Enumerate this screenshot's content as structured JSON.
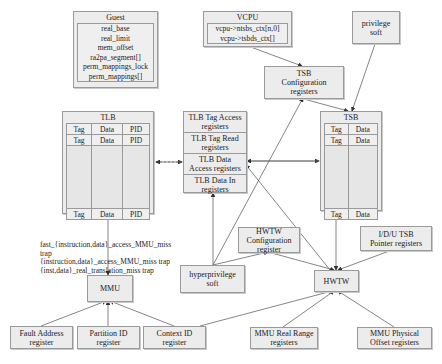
{
  "guest": {
    "title": "Guest",
    "fields": [
      "real_base",
      "real_limit",
      "mem_offset",
      "ra2pa_segment[]",
      "perm_mappings_lock",
      "perm_mappings[]"
    ]
  },
  "vcpu": {
    "title": "VCPU",
    "fields": [
      "vcpu->ntsbs_ctx[n,0]",
      "vcpu->tsbds_ctx[]"
    ]
  },
  "privilege_soft": {
    "line1": "privilege",
    "line2": "soft"
  },
  "tsb_config": {
    "line1": "TSB",
    "line2": "Configuration",
    "line3": "registers"
  },
  "tlb": {
    "title": "TLB",
    "columns": [
      "Tag",
      "Data",
      "PID"
    ],
    "rows": [
      [
        "Tag",
        "Data",
        "PID"
      ],
      [
        "Tag",
        "Data",
        "PID"
      ],
      [
        "",
        "",
        ""
      ],
      [
        "Tag",
        "Data",
        "PID"
      ]
    ]
  },
  "tlb_registers": [
    {
      "line1": "TLB Tag Access",
      "line2": "registers"
    },
    {
      "line1": "TLB Tag Read",
      "line2": "registers"
    },
    {
      "line1": "TLB Data",
      "line2": "Access registers"
    },
    {
      "line1": "TLB Data In",
      "line2": "registers"
    }
  ],
  "tsb": {
    "title": "TSB",
    "rows": [
      [
        "Tag",
        "Data"
      ],
      [
        "Tag",
        "Data"
      ],
      [
        "",
        ""
      ],
      [
        "Tag",
        "Data"
      ]
    ]
  },
  "hwtw_config": {
    "line1": "HWTW",
    "line2": "Configuration",
    "line3": "register"
  },
  "idu_tsb": {
    "line1": "I/D/U TSB",
    "line2": "Pointer registers"
  },
  "hyperprivilege_soft": {
    "line1": "hyperprivilege",
    "line2": "soft"
  },
  "hwtw": {
    "label": "HWTW"
  },
  "mmu": {
    "label": "MMU"
  },
  "traps": [
    "fast_{instruction,data}_access_MMU_miss",
    "trap",
    "{instruction,data}_access_MMU_miss trap",
    "{inst,data}_real_translation_miss trap"
  ],
  "fault_address": {
    "line1": "Fault Address",
    "line2": "register"
  },
  "partition_id": {
    "line1": "Partition ID",
    "line2": "register"
  },
  "context_id": {
    "line1": "Context ID",
    "line2": "register"
  },
  "mmu_real_range": {
    "line1": "MMU Real Range",
    "line2": "registers"
  },
  "mmu_physical_offset": {
    "line1": "MMU Physical",
    "line2": "Offset registers"
  },
  "colors": {
    "box_fill": "#ececec",
    "border": "#9a9a9a",
    "line": "#555555"
  }
}
